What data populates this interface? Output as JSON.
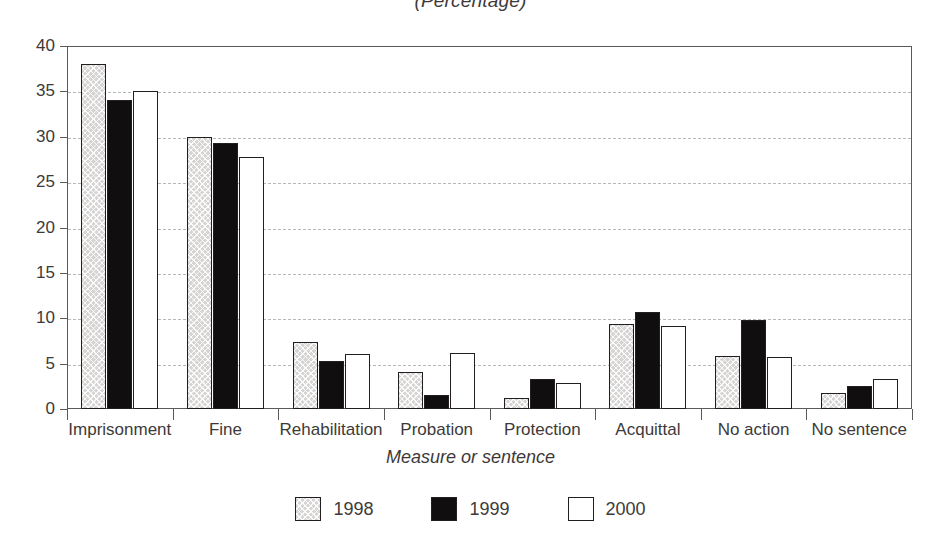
{
  "subtitle": "(Percentage)",
  "chart_data": {
    "type": "bar",
    "title": "",
    "subtitle": "(Percentage)",
    "xlabel": "Measure or sentence",
    "ylabel": "Percentage",
    "ylim": [
      0,
      40
    ],
    "ytick_step": 5,
    "yticks": [
      0,
      5,
      10,
      15,
      20,
      25,
      30,
      35,
      40
    ],
    "grid": true,
    "grid_style": "dashed-horizontal",
    "legend_position": "bottom-center",
    "categories": [
      "Imprisonment",
      "Fine",
      "Rehabilitation",
      "Probation",
      "Protection",
      "Acquittal",
      "No action",
      "No sentence"
    ],
    "series": [
      {
        "name": "1998",
        "color": "#d6d5d4",
        "pattern": "cross-hatch",
        "values": [
          38.0,
          30.0,
          7.4,
          4.1,
          1.2,
          9.4,
          5.8,
          1.8
        ]
      },
      {
        "name": "1999",
        "color": "#100e0e",
        "pattern": "solid",
        "values": [
          34.0,
          29.3,
          5.3,
          1.5,
          3.3,
          10.7,
          9.8,
          2.5
        ]
      },
      {
        "name": "2000",
        "color": "#ffffff",
        "pattern": "outline",
        "values": [
          35.0,
          27.8,
          6.1,
          6.2,
          2.9,
          9.2,
          5.7,
          3.3
        ]
      }
    ]
  },
  "legend": {
    "items": [
      {
        "label": "1998"
      },
      {
        "label": "1999"
      },
      {
        "label": "2000"
      }
    ]
  }
}
